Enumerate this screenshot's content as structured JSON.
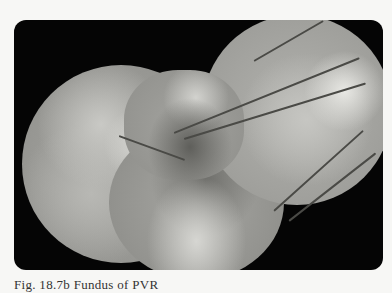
{
  "figure": {
    "panel_color": "#050505",
    "background_color": "#f7f7f5",
    "caption": "Fig. 18.7b Fundus of PVR"
  }
}
